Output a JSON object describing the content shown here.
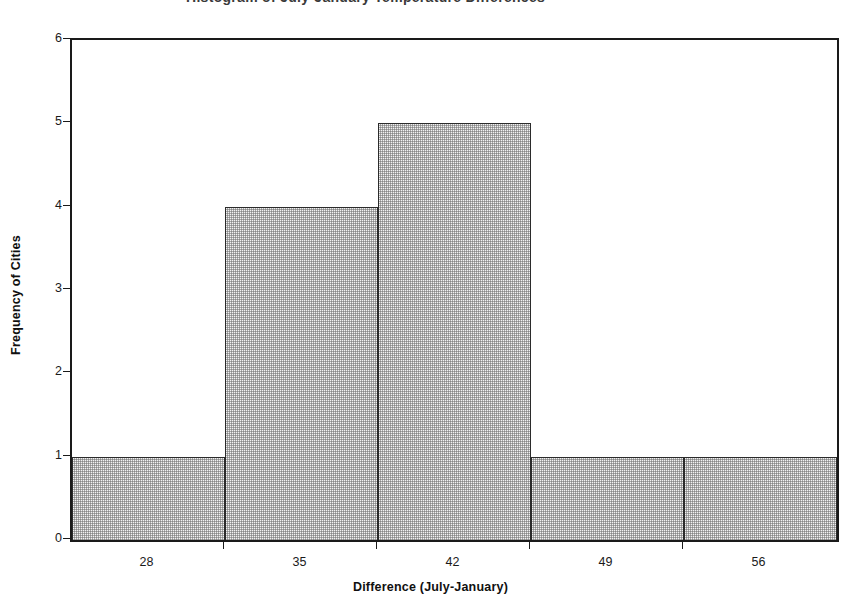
{
  "clipped_header_text": "Histogram of July-January Temperature Differences",
  "chart_data": {
    "type": "bar",
    "title": "",
    "xlabel": "Difference (July-January)",
    "ylabel": "Frequency of Cities",
    "categories": [
      "28",
      "35",
      "42",
      "49",
      "56"
    ],
    "values": [
      1,
      4,
      5,
      1,
      1
    ],
    "bin_edges": [
      24.5,
      31.5,
      38.5,
      45.5,
      52.5,
      59.5
    ],
    "x_tick_labels": [
      "28",
      "35",
      "42",
      "49",
      "56"
    ],
    "y_tick_labels": [
      "0",
      "1",
      "2",
      "3",
      "4",
      "5",
      "6"
    ],
    "ylim": [
      0,
      6
    ],
    "y_major_step": 1,
    "grid": false,
    "legend": false,
    "bar_fill": "#f0f0f0",
    "bar_fill_pattern": "stipple-gray",
    "bar_border": "#2b2b2b",
    "axis_color": "#1a1a1a",
    "background": "#ffffff"
  }
}
